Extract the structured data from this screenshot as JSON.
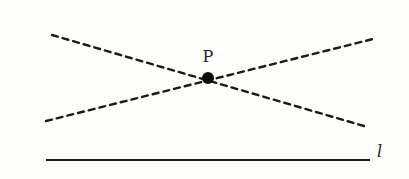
{
  "diagram": {
    "title": "",
    "background": "#fdfdfb",
    "ink_color": "#1a1a1a",
    "point": {
      "label": "P",
      "x": 208,
      "y": 78,
      "radius": 6
    },
    "lines": [
      {
        "name": "dashed-line-1",
        "style": "dashed",
        "x1": 52,
        "y1": 35,
        "x2": 364,
        "y2": 126,
        "passes_through": "P"
      },
      {
        "name": "dashed-line-2",
        "style": "dashed",
        "x1": 46,
        "y1": 121,
        "x2": 373,
        "y2": 39,
        "passes_through": "P"
      }
    ],
    "base_line": {
      "label": "l",
      "style": "solid",
      "x1": 46,
      "y1": 160,
      "x2": 370,
      "y2": 160
    }
  }
}
